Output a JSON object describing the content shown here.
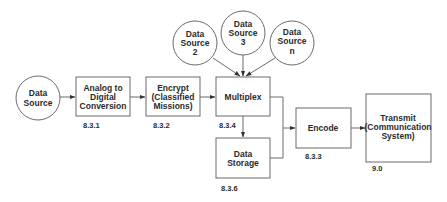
{
  "diagram": {
    "nodes": {
      "data_source": {
        "lines": [
          "Data",
          "Source"
        ]
      },
      "data_source_2": {
        "lines": [
          "Data",
          "Source",
          "2"
        ]
      },
      "data_source_3": {
        "lines": [
          "Data",
          "Source",
          "3"
        ]
      },
      "data_source_n": {
        "lines": [
          "Data",
          "Source",
          "n"
        ]
      },
      "analog_to_digital": {
        "lines": [
          "Analog to",
          "Digital",
          "Conversion"
        ],
        "number": "8.3.1"
      },
      "encrypt": {
        "lines": [
          "Encrypt",
          "(Classified",
          "Missions)"
        ],
        "number": "8.3.2"
      },
      "multiplex": {
        "lines": [
          "Multiplex"
        ],
        "number": "8.3.4"
      },
      "data_storage": {
        "lines": [
          "Data",
          "Storage"
        ],
        "number": "8.3.6"
      },
      "encode": {
        "lines": [
          "Encode"
        ],
        "number": "8.3.3"
      },
      "transmit": {
        "lines": [
          "Transmit",
          "(Communication",
          "System)"
        ],
        "number": "9.0"
      }
    },
    "edges": [
      {
        "from": "Data Source",
        "to": "Analog to Digital Conversion"
      },
      {
        "from": "Analog to Digital Conversion",
        "to": "Encrypt (Classified Missions)"
      },
      {
        "from": "Encrypt (Classified Missions)",
        "to": "Multiplex"
      },
      {
        "from": "Data Source 2",
        "to": "Multiplex"
      },
      {
        "from": "Data Source 3",
        "to": "Multiplex"
      },
      {
        "from": "Data Source n",
        "to": "Multiplex"
      },
      {
        "from": "Multiplex",
        "to": "Data Storage"
      },
      {
        "from": "Multiplex",
        "to": "Encode"
      },
      {
        "from": "Data Storage",
        "to": "Encode"
      },
      {
        "from": "Encode",
        "to": "Transmit (Communication System)"
      }
    ]
  }
}
